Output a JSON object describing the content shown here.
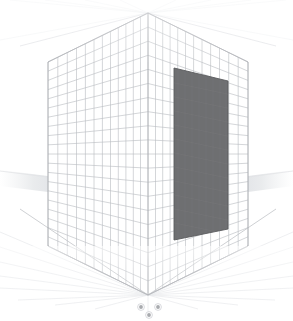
{
  "viewport": {
    "name": "3d-perspective-viewport",
    "background_color": "#ffffff",
    "width": 293,
    "height": 321
  },
  "chart_data": {
    "type": "scatter",
    "title": "",
    "subtitle": "",
    "xlabel": "",
    "ylabel": "",
    "grid": true,
    "legend_position": "none",
    "projection": "two-wall interior perspective corner view",
    "annotations": [],
    "categories": [],
    "values": [],
    "series": [
      {
        "name": "left-wall-grid",
        "values": [],
        "columns": 12,
        "rows": 20,
        "line_color": "#b9bcc2"
      },
      {
        "name": "right-wall-grid",
        "values": [],
        "columns": 12,
        "rows": 20,
        "line_color": "#b9bcc2"
      },
      {
        "name": "floor-radial-grid",
        "values": [],
        "rays": 17,
        "line_color": "#e2e4e8"
      },
      {
        "name": "ceiling-radial-grid",
        "values": [],
        "rays": 9,
        "line_color": "#eef0f2"
      }
    ]
  },
  "geometry": {
    "corner_top": {
      "x": 148,
      "y": 13
    },
    "corner_bottom": {
      "x": 148,
      "y": 295
    },
    "left_wall_outer_x": 48,
    "right_wall_outer_x": 248,
    "horizon_y": 176,
    "wall_top_left": {
      "x": 48,
      "y": 62
    },
    "wall_top_right": {
      "x": 248,
      "y": 62
    },
    "wall_bottom_left": {
      "x": 48,
      "y": 246
    },
    "wall_bottom_right": {
      "x": 248,
      "y": 246
    }
  },
  "colors": {
    "grid_line": "#b9bcc2",
    "grid_line_faint": "#d9dbe0",
    "floor_ray": "#e4e6ea",
    "ceiling_ray": "#f0f1f3",
    "panel_fill": "#6e6f71",
    "panel_edge": "#5a5b5d",
    "panel_grid": "#7a7b7d",
    "horizon_band": "#e8eaec",
    "gizmo_dot": "#a8aaae",
    "gizmo_dot_ring": "#cfd1d5",
    "silhouette_edge": "#c2c4c8"
  },
  "objects": [
    {
      "name": "dark-panel",
      "label": "selected-panel",
      "shape": "quad",
      "fill": "#6e6f71",
      "points": "174,68 228,81 228,229 174,240",
      "has_grid_overlay": true,
      "selected": true
    }
  ],
  "gizmo": {
    "name": "origin-axis-handles",
    "dots": [
      {
        "x": 141,
        "y": 307,
        "r": 2.6,
        "label": "handle-x"
      },
      {
        "x": 158,
        "y": 307,
        "r": 2.6,
        "label": "handle-y"
      },
      {
        "x": 149,
        "y": 315,
        "r": 2.6,
        "label": "handle-z"
      }
    ]
  },
  "horizon": {
    "name": "ground-plane-band",
    "left_wedge": "0,170 48,176 48,192 0,186",
    "right_wedge": "293,170 248,176 248,192 293,186",
    "fill": "#ebedef"
  }
}
